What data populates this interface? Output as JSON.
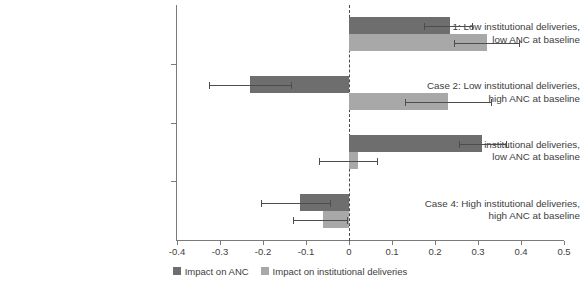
{
  "chart_data": {
    "type": "bar",
    "orientation": "horizontal",
    "title": "",
    "xlabel": "",
    "ylabel": "",
    "xlim": [
      -0.4,
      0.5
    ],
    "xticks": [
      "-0.4",
      "-0.3",
      "-0.2",
      "-0.1",
      "0",
      "0.1",
      "0.2",
      "0.3",
      "0.4",
      "0.5"
    ],
    "xtick_values": [
      -0.4,
      -0.3,
      -0.2,
      -0.1,
      0,
      0.1,
      0.2,
      0.3,
      0.4,
      0.5
    ],
    "grid": false,
    "zero_reference_line": 0,
    "legend_position": "bottom-center",
    "categories": [
      "Case 1: Low institutional deliveries, low ANC at baseline",
      "Case 2: Low institutional deliveries, high ANC at baseline",
      "Case 3: High institutional deliveries, low ANC at baseline",
      "Case 4: High institutional deliveries, high ANC at baseline"
    ],
    "category_lines": [
      [
        "Case 1: Low institutional deliveries,",
        "low ANC at baseline"
      ],
      [
        "Case 2: Low institutional deliveries,",
        "high ANC at baseline"
      ],
      [
        "Case 3: High institutional deliveries,",
        "low ANC at baseline"
      ],
      [
        "Case 4: High institutional deliveries,",
        "high ANC at baseline"
      ]
    ],
    "series": [
      {
        "name": "Impact on ANC",
        "color": "#6e6e6e",
        "values": [
          0.235,
          -0.23,
          0.31,
          -0.115
        ],
        "ci_low": [
          0.175,
          -0.325,
          0.255,
          -0.205
        ],
        "ci_high": [
          0.285,
          -0.135,
          0.365,
          -0.045
        ]
      },
      {
        "name": "Impact on institutional deliveries",
        "color": "#a8a8a8",
        "values": [
          0.32,
          0.23,
          0.02,
          -0.06
        ],
        "ci_low": [
          0.245,
          0.13,
          -0.07,
          -0.13
        ],
        "ci_high": [
          0.395,
          0.33,
          0.065,
          -0.005
        ]
      }
    ]
  },
  "legend": {
    "items": [
      {
        "label": "Impact on ANC",
        "color": "#6e6e6e"
      },
      {
        "label": "Impact on institutional deliveries",
        "color": "#a8a8a8"
      }
    ]
  },
  "colors": {
    "anc": "#6e6e6e",
    "institutional": "#a8a8a8",
    "axis": "#7a7a7a",
    "error_bar": "#4d4d4d",
    "text": "#3d3d3d",
    "background": "#ffffff"
  }
}
